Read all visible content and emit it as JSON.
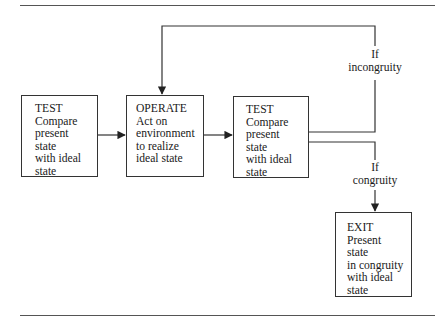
{
  "diagram": {
    "type": "TOTE flowchart",
    "nodes": [
      {
        "id": "test1",
        "title": "TEST",
        "lines": [
          "Compare",
          "present",
          "state",
          "with ideal",
          "state"
        ]
      },
      {
        "id": "operate",
        "title": "OPERATE",
        "lines": [
          "Act on",
          "environment",
          "to realize",
          "ideal state"
        ]
      },
      {
        "id": "test2",
        "title": "TEST",
        "lines": [
          "Compare",
          "present",
          "state",
          "with ideal",
          "state"
        ]
      },
      {
        "id": "exit",
        "title": "EXIT",
        "lines": [
          "Present",
          "state",
          "in congruity",
          "with ideal",
          "state"
        ]
      }
    ],
    "edges": [
      {
        "from": "test1",
        "to": "operate",
        "label": ""
      },
      {
        "from": "operate",
        "to": "test2",
        "label": ""
      },
      {
        "from": "test2",
        "to": "operate",
        "label_line1": "If",
        "label_line2": "incongruity"
      },
      {
        "from": "test2",
        "to": "exit",
        "label_line1": "If",
        "label_line2": "congruity"
      }
    ],
    "colors": {
      "line": "#333333",
      "rule": "#555555",
      "text": "#1a1a1a"
    }
  }
}
